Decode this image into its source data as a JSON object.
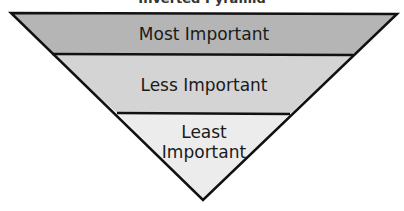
{
  "diagram": {
    "title": "Inverted Pyramid",
    "levels": [
      {
        "label": "Most Important",
        "lines": [
          "Most Important"
        ],
        "fill": "#b5b5b5"
      },
      {
        "label": "Less Important",
        "lines": [
          "Less Important"
        ],
        "fill": "#d4d4d4"
      },
      {
        "label": "Least Important",
        "lines": [
          "Least",
          "Important"
        ],
        "fill": "#ececec"
      }
    ],
    "stroke": "#111111"
  }
}
